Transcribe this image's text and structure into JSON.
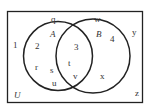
{
  "diagram": {
    "type": "venn",
    "universe_label": "U",
    "sets": [
      {
        "name": "A"
      },
      {
        "name": "B"
      }
    ],
    "regions": {
      "only_A": [
        "2",
        "r",
        "s",
        "u"
      ],
      "A_and_B": [
        "3",
        "t",
        "v"
      ],
      "only_B": [
        "4",
        "x"
      ],
      "outside": [
        "1",
        "q",
        "w",
        "y",
        "z"
      ]
    },
    "colors": {
      "stroke": "#222222",
      "text": "#333333",
      "background": "#ffffff"
    }
  },
  "labels": {
    "U": "U",
    "A": "A",
    "B": "B",
    "n1": "1",
    "n2": "2",
    "n3": "3",
    "n4": "4",
    "q": "q",
    "w": "w",
    "y": "y",
    "z": "z",
    "r": "r",
    "s": "s",
    "u": "u",
    "t": "t",
    "v": "v",
    "x": "x"
  }
}
